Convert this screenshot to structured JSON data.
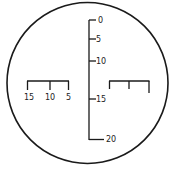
{
  "diagram": {
    "type": "reticle",
    "colors": {
      "line": "#1a1a1a",
      "background": "#ffffff"
    },
    "vertical_scale": {
      "labels": [
        "0",
        "5",
        "10",
        "15",
        "20"
      ]
    },
    "left_scale": {
      "labels": [
        "15",
        "10",
        "5"
      ]
    },
    "right_scale": {
      "labels": []
    }
  }
}
